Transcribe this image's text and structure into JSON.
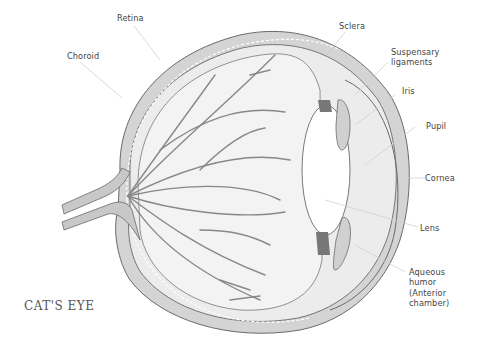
{
  "title": "CAT'S EYE",
  "labels": {
    "retina": "Retina",
    "choroid": "Choroid",
    "sclera": "Sclera",
    "suspensary_1": "Suspensary",
    "suspensary_2": "ligaments",
    "iris": "Iris",
    "pupil": "Pupil",
    "cornea": "Cornea",
    "lens": "Lens",
    "aqueous_1": "Aqueous",
    "aqueous_2": "humor",
    "aqueous_3": "(Anterior",
    "aqueous_4": "chamber)"
  },
  "colors": {
    "outline": "#6a6a6a",
    "fill_gray": "#cfcfcf",
    "fill_light": "#e6e6e6",
    "leader": "#d0d0d0",
    "text": "#444444"
  }
}
